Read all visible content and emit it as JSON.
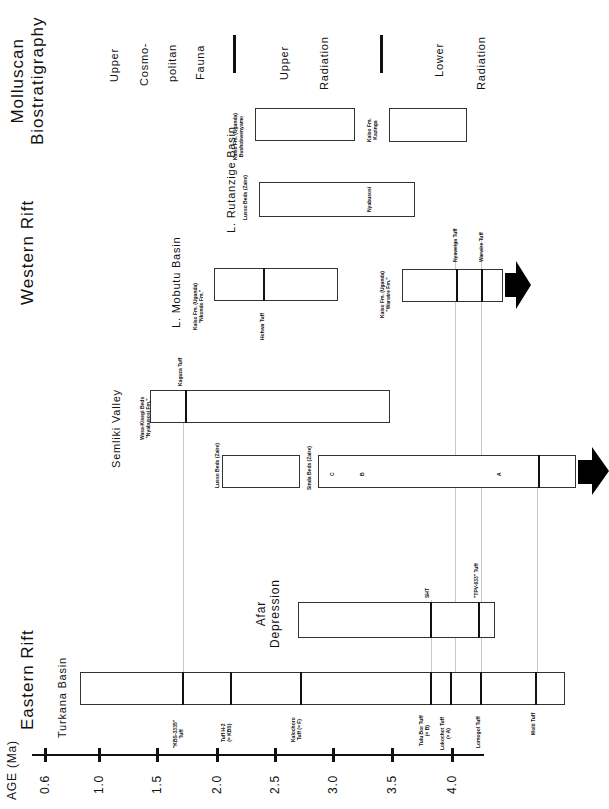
{
  "axis": {
    "label": "AGE (Ma)",
    "ticks": [
      {
        "label": "0.6",
        "x": 45
      },
      {
        "label": "1.0",
        "x": 99
      },
      {
        "label": "1.5",
        "x": 157
      },
      {
        "label": "2.0",
        "x": 217
      },
      {
        "label": "2.5",
        "x": 275
      },
      {
        "label": "3.0",
        "x": 333
      },
      {
        "label": "3.5",
        "x": 392
      },
      {
        "label": "4.0",
        "x": 452
      }
    ]
  },
  "regions": {
    "eastern_rift": "Eastern Rift",
    "western_rift": "Western Rift",
    "molluscan": {
      "line1": "Molluscan",
      "line2": "Biostratigraphy"
    }
  },
  "basins": {
    "turkana": {
      "title": "Turkana Basin",
      "markers": [
        {
          "label": "\"KBS-3335\" Tuff",
          "line1": "\"KBS-3335\"",
          "line2": "Tuff"
        },
        {
          "line1": "Tuff H-2",
          "line2": "(= KBS)"
        },
        {
          "line1": "Kalochoro",
          "line2": "Tuff (= F)"
        },
        {
          "line1": "Tulu Bor Tuff",
          "line2": "(= B)"
        },
        {
          "line1": "Lokochot Tuff",
          "line2": "(= A)"
        },
        {
          "line1": "Lomogol Tuff",
          "line2": ""
        },
        {
          "line1": "Moiti Tuff",
          "line2": ""
        }
      ]
    },
    "afar": {
      "title_line1": "Afar",
      "title_line2": "Depression",
      "markers": [
        "SHT",
        "\"TPV-033\" Tuff"
      ]
    },
    "semliki": {
      "title": "Semliki Valley",
      "wasa": {
        "line1": "Wasa-Kisegi Beds",
        "line2": "\"Nyabusosi Fm.\"",
        "marker": "Kaguza Tuff"
      },
      "lusso": {
        "label": "Lusso Beds (Zaire)"
      },
      "sinda": {
        "label": "Sinda Beds (Zaire)",
        "letters": [
          "C",
          "B",
          "A"
        ]
      }
    },
    "mobutu": {
      "title": "L. Mobutu Basin",
      "upper": {
        "line1": "Kaiso Fm. (Uganda)",
        "line2": "\"Nkondo Fm.\"",
        "marker": "Hohwa Tuff"
      },
      "lower": {
        "line1": "Kaiso Fm. (Uganda)",
        "line2": "\"Warwire Fm.\"",
        "markers": [
          "Nyaweiga Tuff",
          "Warwire Tuff"
        ]
      }
    },
    "rutanzige": {
      "title": "L. Rutanzige Basin",
      "lusso": {
        "label": "Lusso Beds (Zaire)",
        "marker": "Nyabusosi"
      },
      "upper": {
        "line1": "Kaiso Fm. (Uganda)",
        "line2": "Bushobwenyamo"
      },
      "lower": {
        "line1": "Kaiso Fm.",
        "line2": "Kazinga"
      }
    }
  },
  "biostratigraphy": {
    "zone1": [
      "Upper",
      "Cosmo-",
      "politan",
      "Fauna"
    ],
    "zone2": [
      "Upper",
      "Radiation"
    ],
    "zone3": [
      "Lower",
      "Radiation"
    ]
  }
}
